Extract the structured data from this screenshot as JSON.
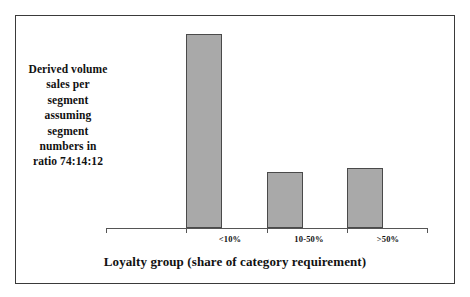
{
  "chart_data": {
    "type": "bar",
    "title": "",
    "subtitle": "",
    "xlabel": "Loyalty group (share of category requirement)",
    "ylabel": "",
    "categories": [
      "<10%",
      "10-50%",
      ">50%"
    ],
    "values": [
      100,
      29,
      31
    ],
    "series": [
      {
        "name": "Derived volume sales per segment",
        "values": [
          100,
          29,
          31
        ]
      }
    ],
    "ylim": [
      0,
      103
    ],
    "grid": false,
    "legend": false,
    "legend_position": "none",
    "bar_fill_color": "#a9a9a9",
    "bar_edge_color": "#4a4a4a",
    "axis_color": "#555555",
    "frame_color": "#3a3a3a",
    "annotation": {
      "text": "Derived volume sales per segment assuming segment numbers in ratio 74:14:12",
      "lines": [
        "Derived volume",
        "sales per",
        "segment",
        "assuming",
        "segment",
        "numbers in",
        "ratio 74:14:12"
      ]
    }
  },
  "figure": {
    "annotation_lines": [
      "Derived volume",
      "sales per",
      "segment",
      "assuming",
      "segment",
      "numbers in",
      "ratio 74:14:12"
    ],
    "x_axis_title": "Loyalty group (share of category requirement)",
    "categories": [
      "<10%",
      "10-50%",
      ">50%"
    ]
  }
}
